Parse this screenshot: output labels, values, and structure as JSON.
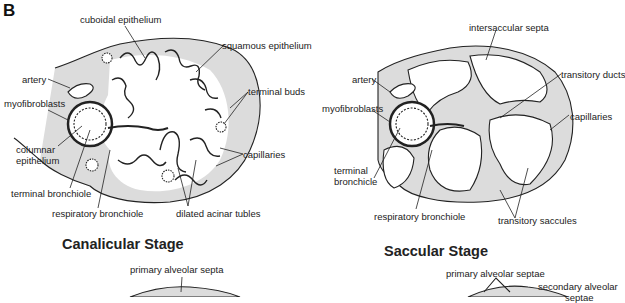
{
  "panel_letter": "B",
  "canalicular": {
    "title": "Canalicular Stage",
    "labels": {
      "cuboidal_epithelium": "cuboidal epithelium",
      "squamous_epithelium": "squamous epithelium",
      "artery": "artery",
      "terminal_buds": "terminal buds",
      "myofibroblasts": "myofibroblasts",
      "columnar_epithelium_1": "columnar",
      "columnar_epithelium_2": "epithelium",
      "capillaries": "capillaries",
      "terminal_bronchiole": "terminal bronchiole",
      "respiratory_bronchiole": "respiratory bronchiole",
      "dilated_acinar_tubles": "dilated acinar tubles"
    }
  },
  "saccular": {
    "title": "Saccular Stage",
    "labels": {
      "intersaccular_septa": "intersaccular septa",
      "artery": "artery",
      "transitory_ducts": "transitory ducts",
      "myofibroblasts": "myofibroblasts",
      "capillaries": "capillaries",
      "terminal_bronchiole_1": "terminal",
      "terminal_bronchiole_2": "bronchicle",
      "respiratory_bronchiole": "respiratory bronchiole",
      "transitory_saccules": "transitory saccules"
    }
  },
  "alveolar_partial": {
    "labels": {
      "primary_alveolar_septa": "primary alveolar septa",
      "primary_alveolar_septae": "primary alveolar septae",
      "secondary_alveolar": "secondary alveolar",
      "septae": "septae"
    }
  },
  "colors": {
    "ink": "#222222",
    "shading": "#d9d9d9",
    "background": "#ffffff"
  }
}
